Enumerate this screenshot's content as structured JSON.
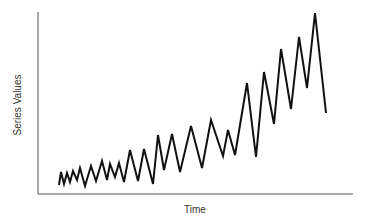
{
  "chart_data": {
    "type": "line",
    "title": "",
    "xlabel": "Time",
    "ylabel": "Series Values",
    "grid": false,
    "legend": null,
    "x_ticks": [],
    "y_ticks": [],
    "note": "No tick labels shown; values are relative (0 = x-axis, 100 = top of y-axis), read from pixel positions.",
    "x": [
      1,
      2,
      3,
      4,
      5,
      6,
      7,
      8,
      9,
      10,
      11,
      12,
      13,
      14,
      15,
      16,
      17,
      18,
      19,
      20,
      21,
      22,
      23,
      24,
      25,
      26,
      27,
      28,
      29,
      30,
      31,
      32,
      33,
      34,
      35,
      36,
      37,
      38,
      39,
      40
    ],
    "series": [
      {
        "name": "Series",
        "color": "#111111",
        "values": [
          5,
          12,
          5,
          11,
          7,
          13,
          8,
          14,
          5,
          15,
          7,
          18,
          8,
          17,
          9,
          17,
          7,
          24,
          7,
          25,
          5,
          33,
          13,
          33,
          12,
          38,
          14,
          41,
          21,
          36,
          21,
          61,
          20,
          67,
          39,
          80,
          47,
          86,
          58,
          45
        ]
      }
    ],
    "pixel_points": [
      [
        59,
        185
      ],
      [
        61,
        172
      ],
      [
        64,
        184
      ],
      [
        67,
        173
      ],
      [
        70,
        182
      ],
      [
        73,
        171
      ],
      [
        77,
        180
      ],
      [
        80,
        168
      ],
      [
        85,
        186
      ],
      [
        91,
        166
      ],
      [
        96,
        181
      ],
      [
        102,
        161
      ],
      [
        107,
        180
      ],
      [
        110,
        164
      ],
      [
        115,
        177
      ],
      [
        119,
        163
      ],
      [
        124,
        182
      ],
      [
        130,
        150
      ],
      [
        138,
        181
      ],
      [
        144,
        149
      ],
      [
        153,
        184
      ],
      [
        158,
        135
      ],
      [
        164,
        170
      ],
      [
        172,
        134
      ],
      [
        180,
        172
      ],
      [
        191,
        126
      ],
      [
        202,
        168
      ],
      [
        211,
        120
      ],
      [
        223,
        156
      ],
      [
        228,
        130
      ],
      [
        235,
        155
      ],
      [
        247,
        83
      ],
      [
        256,
        157
      ],
      [
        264,
        72
      ],
      [
        274,
        124
      ],
      [
        281,
        49
      ],
      [
        291,
        109
      ],
      [
        299,
        37
      ],
      [
        307,
        88
      ],
      [
        315,
        13
      ],
      [
        326,
        113
      ]
    ]
  },
  "colors": {
    "background": "#ffffff",
    "axis": "#555555",
    "line": "#111111",
    "label": "#333333"
  }
}
